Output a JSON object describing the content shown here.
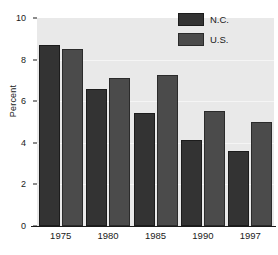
{
  "chart_data": {
    "type": "bar",
    "title": "",
    "xlabel": "",
    "ylabel": "Percent",
    "categories": [
      "1975",
      "1980",
      "1985",
      "1990",
      "1997"
    ],
    "series": [
      {
        "name": "N.C.",
        "color": "#333333",
        "values": [
          8.7,
          6.6,
          5.45,
          4.15,
          3.6
        ]
      },
      {
        "name": "U.S.",
        "color": "#4b4b4b",
        "values": [
          8.5,
          7.1,
          7.25,
          5.55,
          5.0
        ]
      }
    ],
    "ylim": [
      0,
      10
    ],
    "yticks": [
      0,
      2,
      4,
      6,
      8,
      10
    ],
    "ytick_labels": [
      "0",
      "2",
      "4",
      "6",
      "8",
      "10"
    ],
    "grid": true,
    "gridlines_at": [
      2,
      4,
      6,
      8
    ],
    "legend_position": "top-right",
    "legend_entries": [
      "N.C.",
      "U.S."
    ],
    "plot_background": "#e9e9e9",
    "figure_background": "#ffffff",
    "axis_color": "#1a1a1a",
    "gridline_color": "#f5f5f5"
  },
  "axes": {
    "y_label": "Percent",
    "y_tick_0": "0",
    "y_tick_1": "2",
    "y_tick_2": "4",
    "y_tick_3": "6",
    "y_tick_4": "8",
    "y_tick_5": "10",
    "x_tick_0": "1975",
    "x_tick_1": "1980",
    "x_tick_2": "1985",
    "x_tick_3": "1990",
    "x_tick_4": "1997"
  },
  "legend": {
    "entry_0_label": "N.C.",
    "entry_1_label": "U.S."
  }
}
